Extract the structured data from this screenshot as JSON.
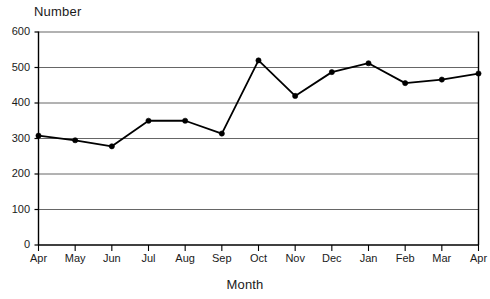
{
  "chart_data": {
    "type": "line",
    "title": "",
    "ylabel": "Number",
    "xlabel": "Month",
    "categories": [
      "Apr",
      "May",
      "Jun",
      "Jul",
      "Aug",
      "Sep",
      "Oct",
      "Nov",
      "Dec",
      "Jan",
      "Feb",
      "Mar",
      "Apr"
    ],
    "values": [
      308,
      295,
      278,
      350,
      350,
      314,
      520,
      420,
      487,
      512,
      456,
      466,
      483
    ],
    "series": [
      {
        "name": "Number",
        "values": [
          308,
          295,
          278,
          350,
          350,
          314,
          520,
          420,
          487,
          512,
          456,
          466,
          483
        ]
      }
    ],
    "ylim": [
      0,
      600
    ],
    "yticks": [
      0,
      100,
      200,
      300,
      400,
      500,
      600
    ],
    "ytick_labels": [
      "0",
      "100",
      "200",
      "300",
      "400",
      "500",
      "600"
    ],
    "xtick_labels": [
      "Apr",
      "May",
      "Jun",
      "Jul",
      "Aug",
      "Sep",
      "Oct",
      "Nov",
      "Dec",
      "Jan",
      "Feb",
      "Mar",
      "Apr"
    ],
    "grid": true,
    "grid_axis": "y",
    "legend": false,
    "legend_position": "none",
    "line_color": "#000000",
    "marker": "circle",
    "marker_color": "#000000",
    "axis_color": "#000000",
    "grid_color": "#666666",
    "background_color": "#ffffff"
  }
}
